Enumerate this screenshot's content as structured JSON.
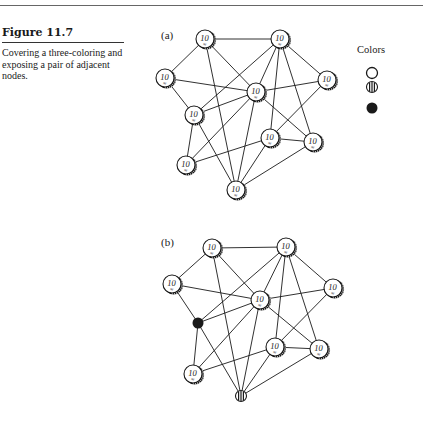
{
  "figure": {
    "title": "Figure 11.7",
    "caption": "Covering a three-coloring and exposing a pair of adjacent nodes."
  },
  "panels": [
    {
      "label": "(a)",
      "label_pos": [
        161,
        38
      ],
      "nodes": [
        {
          "id": "A",
          "x": 205,
          "y": 39,
          "state": "coin"
        },
        {
          "id": "B",
          "x": 280,
          "y": 39,
          "state": "coin"
        },
        {
          "id": "C",
          "x": 165,
          "y": 78,
          "state": "coin"
        },
        {
          "id": "D",
          "x": 256,
          "y": 92,
          "state": "coin"
        },
        {
          "id": "E",
          "x": 327,
          "y": 80,
          "state": "coin"
        },
        {
          "id": "F",
          "x": 194,
          "y": 115,
          "state": "coin"
        },
        {
          "id": "G",
          "x": 270,
          "y": 138,
          "state": "coin"
        },
        {
          "id": "H",
          "x": 313,
          "y": 142,
          "state": "coin"
        },
        {
          "id": "I",
          "x": 186,
          "y": 165,
          "state": "coin"
        },
        {
          "id": "J",
          "x": 236,
          "y": 190,
          "state": "coin"
        }
      ]
    },
    {
      "label": "(b)",
      "label_pos": [
        161,
        245
      ],
      "nodes": [
        {
          "id": "A",
          "x": 212,
          "y": 248,
          "state": "coin"
        },
        {
          "id": "B",
          "x": 286,
          "y": 247,
          "state": "coin"
        },
        {
          "id": "C",
          "x": 172,
          "y": 284,
          "state": "coin"
        },
        {
          "id": "D",
          "x": 260,
          "y": 300,
          "state": "coin"
        },
        {
          "id": "E",
          "x": 333,
          "y": 288,
          "state": "coin"
        },
        {
          "id": "F",
          "x": 198,
          "y": 323,
          "state": "black"
        },
        {
          "id": "G",
          "x": 275,
          "y": 347,
          "state": "coin"
        },
        {
          "id": "H",
          "x": 319,
          "y": 349,
          "state": "coin"
        },
        {
          "id": "I",
          "x": 193,
          "y": 374,
          "state": "coin"
        },
        {
          "id": "J",
          "x": 241,
          "y": 396,
          "state": "striped"
        }
      ]
    }
  ],
  "edges": [
    [
      "A",
      "B"
    ],
    [
      "A",
      "C"
    ],
    [
      "A",
      "D"
    ],
    [
      "A",
      "J"
    ],
    [
      "B",
      "F"
    ],
    [
      "B",
      "D"
    ],
    [
      "B",
      "G"
    ],
    [
      "B",
      "H"
    ],
    [
      "B",
      "E"
    ],
    [
      "C",
      "D"
    ],
    [
      "C",
      "F"
    ],
    [
      "D",
      "E"
    ],
    [
      "D",
      "F"
    ],
    [
      "D",
      "I"
    ],
    [
      "D",
      "J"
    ],
    [
      "D",
      "H"
    ],
    [
      "E",
      "G"
    ],
    [
      "F",
      "I"
    ],
    [
      "F",
      "J"
    ],
    [
      "G",
      "H"
    ],
    [
      "G",
      "I"
    ],
    [
      "G",
      "J"
    ],
    [
      "H",
      "J"
    ]
  ],
  "coin": {
    "value": "10",
    "symbol": "≈"
  },
  "legend": {
    "title": "Colors",
    "items": [
      {
        "name": "white",
        "state": "white",
        "x": 372,
        "y": 73
      },
      {
        "name": "striped",
        "state": "striped",
        "x": 372,
        "y": 87
      },
      {
        "name": "black",
        "state": "black",
        "x": 372,
        "y": 108
      }
    ]
  },
  "colors": {
    "ink": "#1a1a1a",
    "paper": "#ffffff"
  }
}
